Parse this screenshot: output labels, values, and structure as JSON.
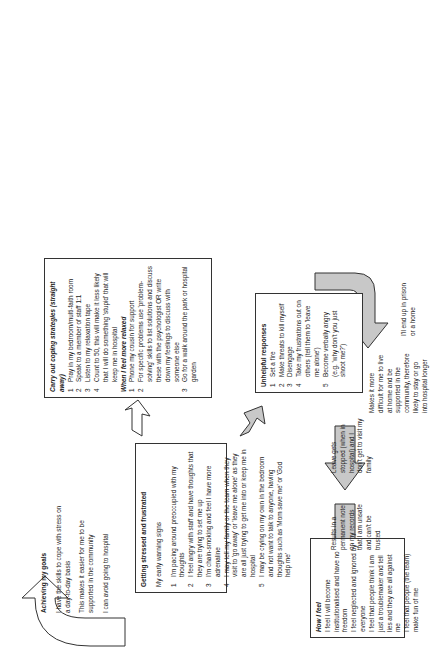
{
  "achieving": {
    "title": "Achieving my goals",
    "lines": [
      "I have the skills to cope with stress on a day-to-day basis",
      "This makes it easier for me to be supported in the community",
      "I can avoid going to hospital"
    ]
  },
  "stressed": {
    "title": "Getting stressed and frustrated",
    "subtitle": "My early warning signs",
    "items": [
      {
        "n": "1",
        "text": "I'm pacing around preoccupied with my thoughts"
      },
      {
        "n": "2",
        "text": "I feel angry with staff and have thoughts that they are trying to set me up"
      },
      {
        "n": "3",
        "text": "I'm chain-smoking and feel I have more adrenaline"
      },
      {
        "n": "4",
        "text": "I may tell my family or the team when they visit to 'go away' or 'leave me alone' as they are all just trying to get me into or keep me in hospital"
      },
      {
        "n": "5",
        "text": "I may be crying on my own in the bedroom and not want to talk to anyone, having thoughts such as 'Mom save me' or 'God help me'"
      }
    ]
  },
  "coping": {
    "title": "Carry out coping strategies (straight away)",
    "items": [
      {
        "n": "1",
        "text": "Pray in my bedroom/multi-faith room"
      },
      {
        "n": "2",
        "text": "Speak to a member of staff 1:1"
      },
      {
        "n": "3",
        "text": "Listen to my relaxation tape"
      },
      {
        "n": "4",
        "text": "Count to 50, this will make it less likely that I will do something 'stupid' that will keep me in hospital"
      }
    ],
    "subtitle": "When I feel more relaxed",
    "items2": [
      {
        "n": "1",
        "text": "Phone my cousin for support"
      },
      {
        "n": "2",
        "text": "For specific problems use 'problem-solving' skills to list solutions and discuss these with the psychologist OR write down my feelings to discuss with someone else"
      },
      {
        "n": "3",
        "text": "Go for a walk around the park or hospital garden"
      }
    ]
  },
  "unhelpful": {
    "title": "Unhelpful responses",
    "items": [
      {
        "n": "1",
        "text": "Set a fire"
      },
      {
        "n": "2",
        "text": "Make threats to kill myself"
      },
      {
        "n": "3",
        "text": "Disengage"
      },
      {
        "n": "4",
        "text": "Take my frustrations out on others (tell them to 'leave me alone')"
      },
      {
        "n": "5",
        "text": "Become verbally angry (e.g. 'why don't you just shoot me?')"
      }
    ]
  },
  "how_i_feel": {
    "title": "How I feel",
    "lines": [
      "I feel I will become institutionalised and have no freedom",
      "I feel neglected and ignored by everyone",
      "I feel that people think I am just a troublemaker and tell lies and they are all against me",
      "I feel that people (the team) make fun of me"
    ]
  },
  "consequences": [
    "Results in a permanent note on my records that I am unsafe and can't be trusted",
    "Leave gets stopped (when in hospital) and I don't get to visit my family",
    "Makes it more difficult for me to live at home and be supported in the community, therefore likely to stay or go into hospital longer",
    "I'll end up in prison or a home"
  ],
  "colors": {
    "arrow_gray": "#c8c8c8",
    "border": "#333333"
  }
}
